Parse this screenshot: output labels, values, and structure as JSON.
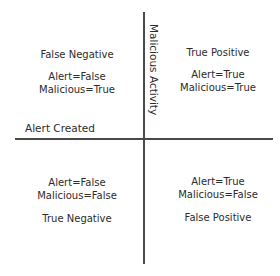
{
  "diagram": {
    "type": "quadrant",
    "axes": {
      "vertical_label": "Malicious Activity",
      "horizontal_label": "Alert Created"
    },
    "quadrants": {
      "top_left": {
        "title": "False Negative",
        "alert": "Alert=False",
        "malicious": "Malicious=True"
      },
      "top_right": {
        "title": "True Positive",
        "alert": "Alert=True",
        "malicious": "Malicious=True"
      },
      "bottom_left": {
        "title": "True Negative",
        "alert": "Alert=False",
        "malicious": "Malicious=False"
      },
      "bottom_right": {
        "title": "False Positive",
        "alert": "Alert=True",
        "malicious": "Malicious=False"
      }
    },
    "colors": {
      "text": "#2b2b2b",
      "axis": "#4a4a4a",
      "background": "#ffffff"
    }
  }
}
